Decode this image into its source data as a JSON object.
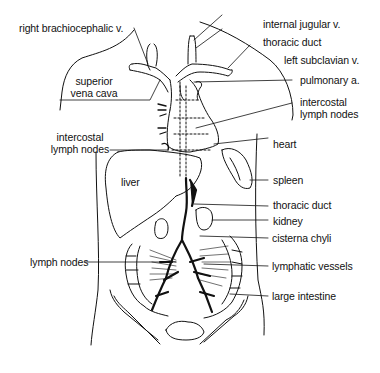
{
  "figure": {
    "type": "anatomical line drawing",
    "line_color": "#111111",
    "background": "#ffffff"
  },
  "labels": {
    "right_brachiocephalic_v": "right brachiocephalic v.",
    "superior_vena_cava": "superior\nvena cava",
    "intercostal_lymph_nodes_left": "intercostal\nlymph nodes",
    "liver": "liver",
    "lymph_nodes": "lymph nodes",
    "internal_jugular_v": "internal jugular v.",
    "thoracic_duct_upper": "thoracic duct",
    "left_subclavian_v": "left subclavian v.",
    "pulmonary_a": "pulmonary a.",
    "intercostal_lymph_nodes_right": "intercostal\nlymph nodes",
    "heart": "heart",
    "spleen": "spleen",
    "thoracic_duct_lower": "thoracic duct",
    "kidney": "kidney",
    "cisterna_chyli": "cisterna chyli",
    "lymphatic_vessels": "lymphatic vessels",
    "large_intestine": "large intestine"
  }
}
